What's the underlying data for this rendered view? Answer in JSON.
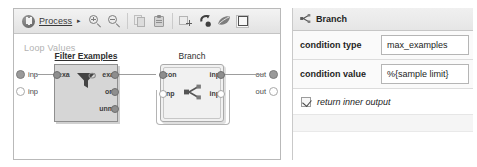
{
  "toolbar": {
    "home_icon": "process-home-icon",
    "breadcrumb_label": "Process",
    "breadcrumb_arrow": "▸",
    "icons": [
      {
        "name": "zoom-in-icon",
        "label": "Zoom In"
      },
      {
        "name": "zoom-out-icon",
        "label": "Zoom Out"
      },
      {
        "name": "copy-icon",
        "label": "Copy"
      },
      {
        "name": "paste-icon",
        "label": "Paste"
      },
      {
        "name": "add-breakpoint-icon",
        "label": "Add"
      },
      {
        "name": "undo-arrow-icon",
        "label": "Undo"
      },
      {
        "name": "leaf-icon",
        "label": "Auto Wire"
      },
      {
        "name": "fit-to-screen-icon",
        "label": "Fit to Screen"
      }
    ]
  },
  "canvas": {
    "title": "Loop Values",
    "left_ports": [
      {
        "label": "inp",
        "filled": true
      },
      {
        "label": "inp",
        "filled": false
      }
    ],
    "right_ports": [
      {
        "label": "out",
        "filled": true
      },
      {
        "label": "out",
        "filled": false
      }
    ],
    "nodes": [
      {
        "id": "filter-examples",
        "title": "Filter Examples",
        "icon": "funnel-icon",
        "selected": true,
        "inputs": [
          {
            "label": "exa",
            "filled": true
          }
        ],
        "outputs": [
          {
            "label": "exa",
            "filled": true
          },
          {
            "label": "ori",
            "filled": true
          },
          {
            "label": "unm",
            "filled": true
          }
        ]
      },
      {
        "id": "branch",
        "title": "Branch",
        "icon": "branch-split-icon",
        "selected": false,
        "inputs": [
          {
            "label": "con",
            "filled": true
          },
          {
            "label": "inp",
            "filled": false
          }
        ],
        "outputs": [
          {
            "label": "inp",
            "filled": true
          },
          {
            "label": "inp",
            "filled": false
          }
        ]
      }
    ]
  },
  "parameters": {
    "header": {
      "icon": "branch-split-icon",
      "title": "Branch"
    },
    "rows": [
      {
        "label": "condition type",
        "value": "max_examples"
      },
      {
        "label": "condition value",
        "value": "%{sample limit}"
      }
    ],
    "checkbox": {
      "label": "return inner output",
      "checked": true
    }
  },
  "colors": {
    "panel_border": "#b9b9b9",
    "toolbar_bg": "#eaeaea",
    "node_fill": "#d6d6d6",
    "node_light_fill": "#f1f1f1",
    "wire": "#9d9d9d",
    "canvas_title": "#b2b2b2"
  }
}
